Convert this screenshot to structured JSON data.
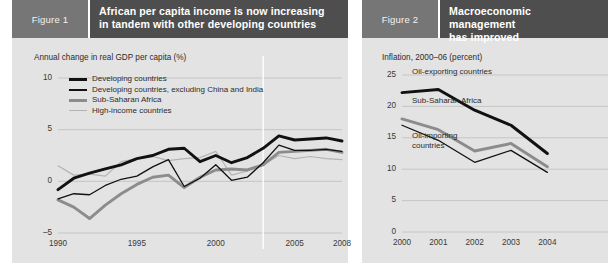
{
  "figures": [
    {
      "tag": "Figure 1",
      "title_line1": "African per capita income is now increasing",
      "title_line2": "in tandem with other developing countries",
      "caption": "Annual change in real GDP per capita (%)"
    },
    {
      "tag": "Figure 2",
      "title_line1": "Macroeconomic management",
      "title_line2": "has improved",
      "caption": "Inflation, 2000–06 (percent)"
    }
  ],
  "colors": {
    "panel_bg": "#e3e3e3",
    "tag_bg": "#767676",
    "title_bg": "#4e4e4e",
    "title_fg": "#ffffff",
    "grid": "#c2c2c2",
    "series_black_thick": "#111111",
    "series_black_thin": "#111111",
    "series_gray_thick": "#8c8c8c",
    "series_gray_thin": "#b4b4b4"
  },
  "chart_data": [
    {
      "type": "line",
      "title": "African per capita income is now increasing in tandem with other developing countries",
      "xlabel": "",
      "ylabel": "Annual change in real GDP per capita (%)",
      "xlim": [
        1990,
        2008
      ],
      "ylim": [
        -5,
        10
      ],
      "yticks": [
        10,
        5,
        0,
        -5
      ],
      "ytick_labels": [
        "10",
        "5",
        "0",
        "–5"
      ],
      "xticks": [
        1990,
        1995,
        2000,
        2005,
        2008
      ],
      "xtick_labels": [
        "1990",
        "1995",
        "2000",
        "2005",
        "2008"
      ],
      "grid": "horizontal",
      "legend_position": "upper-left",
      "x": [
        1990,
        1991,
        1992,
        1993,
        1994,
        1995,
        1996,
        1997,
        1998,
        1999,
        2000,
        2001,
        2002,
        2003,
        2004,
        2005,
        2006,
        2007,
        2008
      ],
      "series": [
        {
          "name": "Developing countries",
          "style": "thick-black",
          "color": "#111111",
          "values": [
            -0.8,
            0.3,
            0.8,
            1.2,
            1.6,
            2.2,
            2.5,
            3.1,
            3.2,
            1.9,
            2.5,
            1.8,
            2.3,
            3.2,
            4.4,
            4.0,
            4.1,
            4.2,
            3.9
          ]
        },
        {
          "name": "Developing countries, excluding China and India",
          "style": "thin-black",
          "color": "#111111",
          "values": [
            -1.7,
            -1.2,
            -1.3,
            -0.4,
            0.2,
            0.5,
            1.4,
            2.1,
            -0.5,
            0.3,
            1.6,
            0.1,
            0.4,
            1.8,
            3.5,
            3.0,
            3.0,
            3.1,
            2.9
          ]
        },
        {
          "name": "Sub-Saharan Africa",
          "style": "thick-gray",
          "color": "#8c8c8c",
          "values": [
            -1.8,
            -2.5,
            -3.6,
            -2.3,
            -1.2,
            -0.3,
            0.4,
            0.6,
            -0.6,
            0.4,
            1.1,
            1.2,
            1.1,
            1.6,
            2.8,
            2.9,
            3.0,
            3.1,
            2.8
          ]
        },
        {
          "name": "High-income countries",
          "style": "thin-gray",
          "color": "#b4b4b4",
          "values": [
            1.5,
            0.6,
            0.7,
            0.5,
            1.9,
            2.2,
            2.4,
            2.0,
            2.2,
            2.3,
            2.9,
            0.6,
            1.0,
            1.6,
            2.5,
            2.2,
            2.4,
            2.2,
            2.1
          ]
        }
      ]
    },
    {
      "type": "line",
      "title": "Macroeconomic management has improved",
      "xlabel": "",
      "ylabel": "Inflation, 2000–06 (percent)",
      "xlim": [
        2000,
        2006
      ],
      "ylim": [
        0,
        25
      ],
      "yticks": [
        25,
        20,
        15,
        10,
        5,
        0
      ],
      "ytick_labels": [
        "25",
        "20",
        "15",
        "10",
        "5",
        "0"
      ],
      "xticks": [
        2000,
        2001,
        2002,
        2003,
        2004
      ],
      "xtick_labels": [
        "2000",
        "2001",
        "2002",
        "2003",
        "2004"
      ],
      "grid": "horizontal",
      "legend_position": "inline-annotations",
      "x": [
        2000,
        2001,
        2002,
        2003,
        2004
      ],
      "series": [
        {
          "name": "Oil-exporting countries",
          "style": "thick-black",
          "color": "#111111",
          "values": [
            22.2,
            22.7,
            19.4,
            17.0,
            12.5
          ]
        },
        {
          "name": "Sub-Saharan Africa",
          "style": "thick-gray",
          "color": "#8c8c8c",
          "values": [
            18.0,
            16.3,
            12.9,
            14.1,
            10.4
          ]
        },
        {
          "name": "Oil-importing countries",
          "style": "thin-black",
          "color": "#111111",
          "values": [
            17.0,
            14.6,
            11.1,
            13.0,
            9.5
          ]
        }
      ]
    }
  ]
}
